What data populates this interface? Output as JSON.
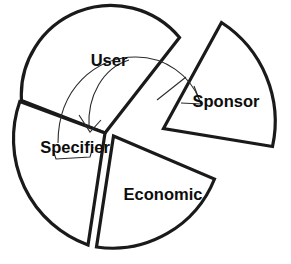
{
  "diagram": {
    "type": "exploded-pie-chart",
    "title": "",
    "background_color": "#ffffff",
    "line_color": "#1a1a1a",
    "label_color": "#0d0d0d",
    "arrow_color": "#2b2b2b",
    "segments": [
      {
        "id": "user",
        "label": "User",
        "label_x": 109,
        "label_y": 62,
        "exploded": false
      },
      {
        "id": "sponsor",
        "label": "Sponsor",
        "label_x": 226,
        "label_y": 103,
        "exploded": true
      },
      {
        "id": "economic",
        "label": "Economic",
        "label_x": 163,
        "label_y": 196,
        "exploded": true
      },
      {
        "id": "specifier",
        "label": "Specifier",
        "label_x": 75,
        "label_y": 149,
        "exploded": false
      }
    ],
    "arrows": [
      {
        "id": "arrow-user-to-sponsor",
        "from": "user",
        "to": "sponsor",
        "direction": "clockwise"
      },
      {
        "id": "arrow-user-to-specifier",
        "from": "user",
        "to": "specifier",
        "direction": "counter-clockwise"
      }
    ]
  }
}
